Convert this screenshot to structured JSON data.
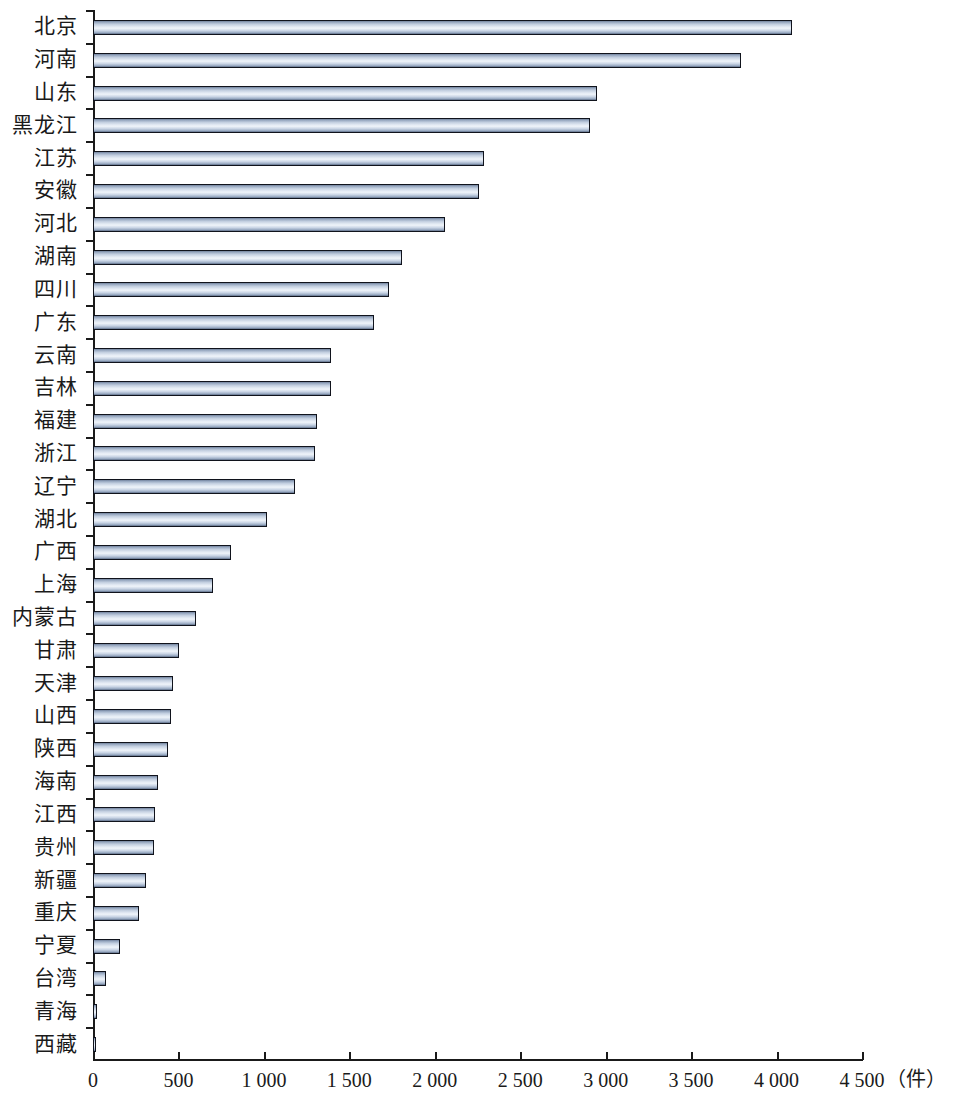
{
  "chart_data": {
    "type": "bar",
    "orientation": "horizontal",
    "title": "",
    "subtitle": "",
    "xlabel": "（件）",
    "ylabel": "",
    "xlim": [
      0,
      4500
    ],
    "xticks": [
      0,
      500,
      1000,
      1500,
      2000,
      2500,
      3000,
      3500,
      4000,
      4500
    ],
    "xtick_labels": [
      "0",
      "500",
      "1 000",
      "1 500",
      "2 000",
      "2 500",
      "3 000",
      "3 500",
      "4 000",
      "4 500"
    ],
    "grid": false,
    "legend": null,
    "unit": "（件）",
    "bar_color": "#cbd8e8",
    "bar_edge_color": "#10131c",
    "background_color": "#ffffff",
    "categories": [
      "北京",
      "河南",
      "山东",
      "黑龙江",
      "江苏",
      "安徽",
      "河北",
      "湖南",
      "四川",
      "广东",
      "云南",
      "吉林",
      "福建",
      "浙江",
      "辽宁",
      "湖北",
      "广西",
      "上海",
      "内蒙古",
      "甘肃",
      "天津",
      "山西",
      "陕西",
      "海南",
      "江西",
      "贵州",
      "新疆",
      "重庆",
      "宁夏",
      "台湾",
      "青海",
      "西藏"
    ],
    "values": [
      4090,
      3790,
      2950,
      2910,
      2290,
      2260,
      2060,
      1810,
      1735,
      1645,
      1390,
      1395,
      1310,
      1300,
      1180,
      1020,
      810,
      700,
      600,
      505,
      470,
      455,
      440,
      378,
      360,
      355,
      310,
      272,
      160,
      75,
      22,
      18
    ],
    "series": [
      {
        "name": "件数",
        "values": [
          4090,
          3790,
          2950,
          2910,
          2290,
          2260,
          2060,
          1810,
          1735,
          1645,
          1390,
          1395,
          1310,
          1300,
          1180,
          1020,
          810,
          700,
          600,
          505,
          470,
          455,
          440,
          378,
          360,
          355,
          310,
          272,
          160,
          75,
          22,
          18
        ]
      }
    ]
  }
}
